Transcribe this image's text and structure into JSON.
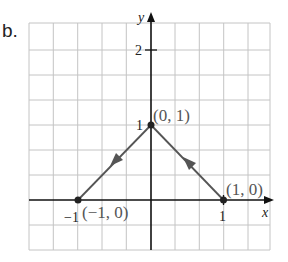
{
  "figure": {
    "part_label": "b.",
    "axes": {
      "x_label": "x",
      "y_label": "y",
      "x_ticks": [
        {
          "value": -1,
          "label": "−1"
        },
        {
          "value": 1,
          "label": "1"
        }
      ],
      "y_ticks": [
        {
          "value": 1,
          "label": "1"
        },
        {
          "value": 2,
          "label": "2"
        }
      ]
    },
    "points": [
      {
        "label": "(−1, 0)",
        "x": -1,
        "y": 0
      },
      {
        "label": "(0, 1)",
        "x": 0,
        "y": 1
      },
      {
        "label": "(1, 0)",
        "x": 1,
        "y": 0
      }
    ],
    "segments": [
      {
        "from": "(0,1)",
        "to": "(-1,0)",
        "direction_arrow": "toward (-1,0)"
      },
      {
        "from": "(1,0)",
        "to": "(0,1)",
        "direction_arrow": "toward (0,1)"
      }
    ],
    "colors": {
      "grid": "#bfbfbf",
      "axis": "#111111",
      "path": "#555555",
      "label": "#555555"
    }
  }
}
